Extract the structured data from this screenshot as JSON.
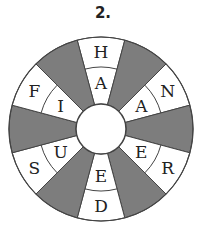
{
  "puzzle": {
    "number_label": "2.",
    "colors": {
      "shaded": "#7d7d7d",
      "blank": "#ffffff",
      "stroke": "#444444"
    },
    "segments": [
      {
        "angle": 90,
        "shaded": false,
        "outer": "H",
        "inner": "A"
      },
      {
        "angle": 60,
        "shaded": true,
        "outer": "",
        "inner": ""
      },
      {
        "angle": 30,
        "shaded": false,
        "outer": "N",
        "inner": "A"
      },
      {
        "angle": 0,
        "shaded": true,
        "outer": "",
        "inner": ""
      },
      {
        "angle": -30,
        "shaded": false,
        "outer": "R",
        "inner": "E"
      },
      {
        "angle": -60,
        "shaded": true,
        "outer": "",
        "inner": ""
      },
      {
        "angle": -90,
        "shaded": false,
        "outer": "D",
        "inner": "E"
      },
      {
        "angle": -120,
        "shaded": true,
        "outer": "",
        "inner": ""
      },
      {
        "angle": -150,
        "shaded": false,
        "outer": "S",
        "inner": "U"
      },
      {
        "angle": 180,
        "shaded": true,
        "outer": "",
        "inner": ""
      },
      {
        "angle": 150,
        "shaded": false,
        "outer": "F",
        "inner": "I"
      },
      {
        "angle": 120,
        "shaded": true,
        "outer": "",
        "inner": ""
      }
    ]
  }
}
